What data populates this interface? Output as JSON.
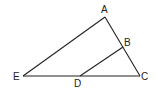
{
  "diagram": {
    "type": "geometry-triangle",
    "points": {
      "A": {
        "label": "A",
        "x": 105,
        "y": 17
      },
      "B": {
        "label": "B",
        "x": 123,
        "y": 47
      },
      "C": {
        "label": "C",
        "x": 140,
        "y": 76
      },
      "D": {
        "label": "D",
        "x": 80,
        "y": 76
      },
      "E": {
        "label": "E",
        "x": 23,
        "y": 76
      }
    },
    "segments": [
      "EA",
      "AC",
      "EC",
      "BD"
    ],
    "colors": {
      "stroke": "#222222",
      "background": "#ffffff"
    }
  }
}
